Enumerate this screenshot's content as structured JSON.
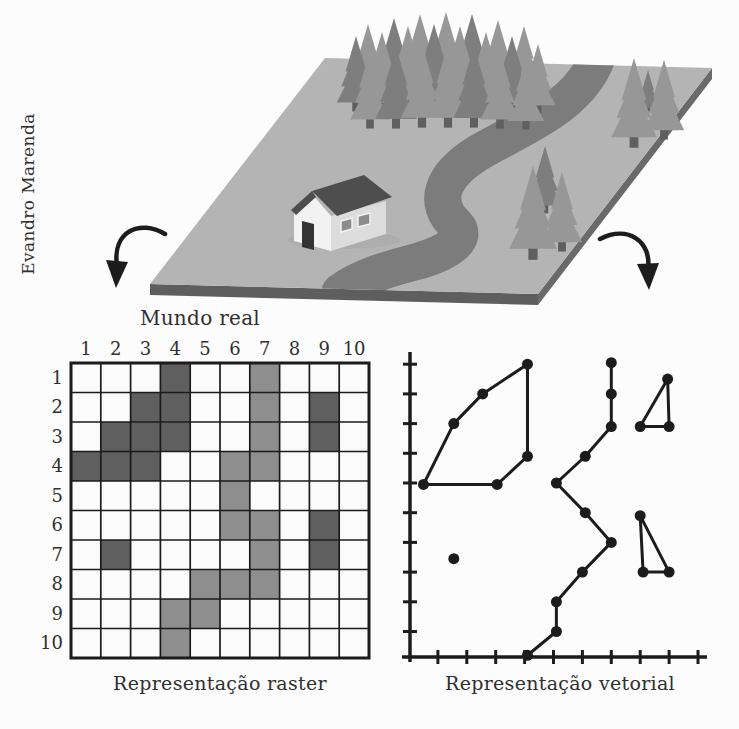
{
  "credit": "Evandro Marenda",
  "labels": {
    "real_world": "Mundo real",
    "raster_caption": "Representação raster",
    "vector_caption": "Representação vetorial"
  },
  "colors": {
    "background": "#fcfcfc",
    "text": "#2f2f2f",
    "ink": "#1c1c1c",
    "grid_line": "#1b1b1b",
    "cell_empty": "#fbfbfb",
    "cell_dark": "#5f5f5f",
    "cell_medium": "#8e8e8e",
    "platform_top": "#b4b4b4",
    "platform_side_front": "#5e5e5e",
    "platform_side_right": "#6a6a6a",
    "river": "#7c7c7c",
    "tree": "#979797",
    "tree_dark": "#7e7e7e",
    "tree_trunk": "#5f5f5f",
    "house_wall": "#f2f2f2",
    "house_wall_shade": "#dcdcdc",
    "house_roof": "#4e4e4e",
    "house_door": "#333333",
    "house_window": "#8c8c8c",
    "shadow": "#a6a6a6"
  },
  "raster": {
    "rows": 10,
    "cols": 10,
    "col_labels": [
      "1",
      "2",
      "3",
      "4",
      "5",
      "6",
      "7",
      "8",
      "9",
      "10"
    ],
    "row_labels": [
      "1",
      "2",
      "3",
      "4",
      "5",
      "6",
      "7",
      "8",
      "9",
      "10"
    ],
    "dark_cells": [
      [
        1,
        4
      ],
      [
        2,
        3
      ],
      [
        2,
        4
      ],
      [
        2,
        9
      ],
      [
        3,
        2
      ],
      [
        3,
        3
      ],
      [
        3,
        4
      ],
      [
        3,
        9
      ],
      [
        4,
        1
      ],
      [
        4,
        2
      ],
      [
        4,
        3
      ],
      [
        6,
        9
      ],
      [
        7,
        2
      ],
      [
        7,
        9
      ]
    ],
    "medium_cells": [
      [
        1,
        7
      ],
      [
        2,
        7
      ],
      [
        3,
        7
      ],
      [
        4,
        6
      ],
      [
        4,
        7
      ],
      [
        5,
        6
      ],
      [
        6,
        6
      ],
      [
        6,
        7
      ],
      [
        7,
        7
      ],
      [
        8,
        5
      ],
      [
        8,
        6
      ],
      [
        8,
        7
      ],
      [
        9,
        4
      ],
      [
        9,
        5
      ],
      [
        10,
        4
      ]
    ]
  },
  "vector": {
    "x_tick_count": 10,
    "y_tick_count": 10,
    "forest_polygon": [
      [
        0.5,
        5.05
      ],
      [
        1.55,
        3
      ],
      [
        2.55,
        2
      ],
      [
        4.1,
        1
      ],
      [
        4.1,
        4.1
      ],
      [
        3.05,
        5.05
      ]
    ],
    "river_polyline": [
      [
        7,
        0.95
      ],
      [
        7,
        2
      ],
      [
        7,
        3.1
      ],
      [
        6.1,
        4.1
      ],
      [
        5.1,
        5
      ],
      [
        6.1,
        6
      ],
      [
        7,
        7
      ],
      [
        6,
        8
      ],
      [
        5.1,
        9
      ],
      [
        5.1,
        10
      ],
      [
        4.1,
        10.8
      ]
    ],
    "house_point": [
      1.55,
      7.55
    ],
    "tree_triangles": [
      [
        [
          8.95,
          1.5
        ],
        [
          8,
          3.1
        ],
        [
          9,
          3.1
        ]
      ],
      [
        [
          8,
          6.1
        ],
        [
          8.1,
          8
        ],
        [
          9,
          8
        ]
      ]
    ]
  }
}
